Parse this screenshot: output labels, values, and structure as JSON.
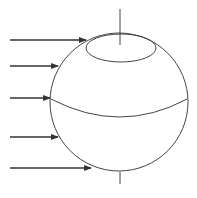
{
  "diagram": {
    "title": "",
    "colors": {
      "background": "#ffffff",
      "stroke": "#444444",
      "arrow": "#333333"
    },
    "sphere": {
      "cx": 119,
      "cy": 102,
      "r": 69
    },
    "axis": {
      "top": {
        "x1": 120,
        "y1": 9,
        "x2": 120,
        "y2": 45
      },
      "bottom": {
        "x1": 120,
        "y1": 172,
        "x2": 120,
        "y2": 184
      }
    },
    "polar_circle": {
      "cx": 121,
      "cy": 48,
      "rx": 35,
      "ry": 14
    },
    "equator": {
      "path": "M 51 99 Q 120 135 187 99"
    },
    "rays": [
      {
        "y": 40,
        "x1": 10,
        "x2": 86
      },
      {
        "y": 66,
        "x1": 10,
        "x2": 58
      },
      {
        "y": 98,
        "x1": 10,
        "x2": 50
      },
      {
        "y": 137,
        "x1": 10,
        "x2": 58
      },
      {
        "y": 168,
        "x1": 10,
        "x2": 91
      }
    ]
  }
}
